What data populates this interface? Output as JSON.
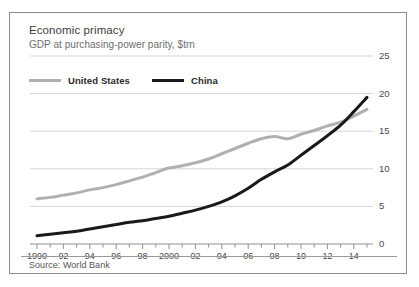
{
  "chart_data": {
    "type": "line",
    "title": "Economic primacy",
    "subtitle": "GDP at purchasing-power parity, $trn",
    "source": "Source: World Bank",
    "xlabel": "",
    "ylabel": "",
    "ylim": [
      0,
      25
    ],
    "xlim": [
      1990,
      2015
    ],
    "y_ticks": [
      0,
      5,
      10,
      15,
      20,
      25
    ],
    "y_tick_labels": [
      "0",
      "5",
      "10",
      "15",
      "20",
      "25"
    ],
    "y_axis_position": "right",
    "grid": true,
    "grid_axis": "y",
    "legend_position": "top-left",
    "x_tick_labels": [
      "1990",
      "92",
      "94",
      "96",
      "98",
      "2000",
      "02",
      "04",
      "06",
      "08",
      "10",
      "12",
      "14"
    ],
    "x_tick_values": [
      1990,
      1992,
      1994,
      1996,
      1998,
      2000,
      2002,
      2004,
      2006,
      2008,
      2010,
      2012,
      2014
    ],
    "x_minor_tick_interval": 1,
    "x": [
      1990,
      1991,
      1992,
      1993,
      1994,
      1995,
      1996,
      1997,
      1998,
      1999,
      2000,
      2001,
      2002,
      2003,
      2004,
      2005,
      2006,
      2007,
      2008,
      2009,
      2010,
      2011,
      2012,
      2013,
      2014,
      2015
    ],
    "series": [
      {
        "name": "United States",
        "color": "#b0b0b0",
        "values": [
          6.0,
          6.2,
          6.5,
          6.8,
          7.2,
          7.5,
          7.9,
          8.4,
          8.9,
          9.5,
          10.1,
          10.4,
          10.8,
          11.3,
          12.0,
          12.7,
          13.4,
          14.0,
          14.3,
          14.0,
          14.6,
          15.1,
          15.7,
          16.2,
          17.0,
          17.9
        ],
        "end_value": 18.0
      },
      {
        "name": "China",
        "color": "#1a1a1a",
        "values": [
          1.1,
          1.3,
          1.5,
          1.7,
          2.0,
          2.3,
          2.6,
          2.9,
          3.1,
          3.4,
          3.7,
          4.1,
          4.5,
          5.0,
          5.6,
          6.4,
          7.4,
          8.6,
          9.6,
          10.5,
          11.8,
          13.1,
          14.4,
          15.8,
          17.6,
          19.5
        ],
        "end_value": 20.2
      }
    ]
  },
  "legend": {
    "items": [
      {
        "label": "United States",
        "key": "us"
      },
      {
        "label": "China",
        "key": "cn"
      }
    ]
  }
}
